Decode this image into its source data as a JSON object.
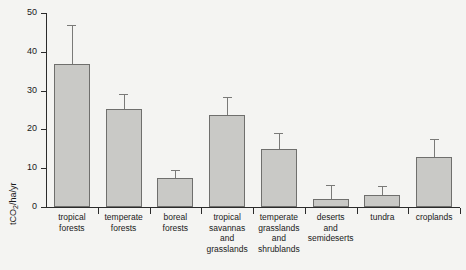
{
  "chart_data": {
    "type": "bar",
    "title": "",
    "xlabel": "",
    "ylabel": "tCO2/ha/yr",
    "ylabel_main": "tCO",
    "ylabel_sub": "2",
    "ylabel_tail": "/ha/yr",
    "ylim": [
      0,
      50
    ],
    "yticks": [
      0,
      10,
      20,
      30,
      40,
      50
    ],
    "ytick_labels": [
      "0",
      "10",
      "20",
      "30",
      "40",
      "50"
    ],
    "grid": false,
    "legend": null,
    "categories": [
      "tropical forests",
      "temperate forests",
      "boreal forests",
      "tropical savannas and grasslands",
      "temperate grasslands and shrublands",
      "deserts and semideserts",
      "tundra",
      "croplands"
    ],
    "category_lines": [
      [
        "tropical",
        "forests"
      ],
      [
        "temperate",
        "forests"
      ],
      [
        "boreal",
        "forests"
      ],
      [
        "tropical",
        "savannas",
        "and",
        "grasslands"
      ],
      [
        "temperate",
        "grasslands",
        "and",
        "shrublands"
      ],
      [
        "deserts",
        "and",
        "semideserts"
      ],
      [
        "tundra"
      ],
      [
        "croplands"
      ]
    ],
    "values": [
      36.8,
      25.3,
      7.5,
      23.7,
      15.0,
      2.0,
      3.1,
      12.8
    ],
    "errors_upper": [
      47.0,
      29.2,
      9.6,
      28.4,
      19.1,
      5.7,
      5.4,
      17.5
    ],
    "bar_color": "#c9c9c6",
    "bar_edge_color": "#6f6f6d",
    "error_color": "#7a7a78",
    "axis_color": "#2b2b2b",
    "background_color": "#f4f4f2"
  }
}
